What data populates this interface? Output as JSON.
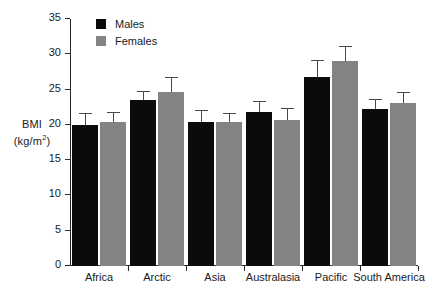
{
  "chart_data": {
    "type": "bar",
    "title": "",
    "xlabel": "",
    "ylabel": "BMI (kg/m2)",
    "ylabel_main": "BMI",
    "ylabel_unit_prefix": "(kg/m",
    "ylabel_unit_sup": "2",
    "ylabel_unit_suffix": ")",
    "categories": [
      "Africa",
      "Arctic",
      "Asia",
      "Australasia",
      "Pacific",
      "South America"
    ],
    "ylim": [
      0,
      35
    ],
    "yticks": [
      0,
      5,
      10,
      15,
      20,
      25,
      30,
      35
    ],
    "ytick_labels": [
      "0",
      "5",
      "10",
      "15",
      "20",
      "25",
      "30",
      "35"
    ],
    "grid": false,
    "legend_position": "top-left-inside",
    "error_bar_style": "upper-only",
    "series": [
      {
        "name": "Males",
        "color": "#0b0b0b",
        "values": [
          20.0,
          23.5,
          20.4,
          21.8,
          26.8,
          22.3
        ],
        "errors": [
          1.6,
          1.1,
          1.6,
          1.4,
          2.3,
          1.2
        ]
      },
      {
        "name": "Females",
        "color": "#838383",
        "values": [
          20.4,
          24.7,
          20.4,
          20.7,
          29.1,
          23.1
        ],
        "errors": [
          1.3,
          1.9,
          1.1,
          1.5,
          1.9,
          1.4
        ]
      }
    ]
  },
  "legend": {
    "items": [
      {
        "label": "Males",
        "color": "#0b0b0b"
      },
      {
        "label": "Females",
        "color": "#838383"
      }
    ]
  }
}
